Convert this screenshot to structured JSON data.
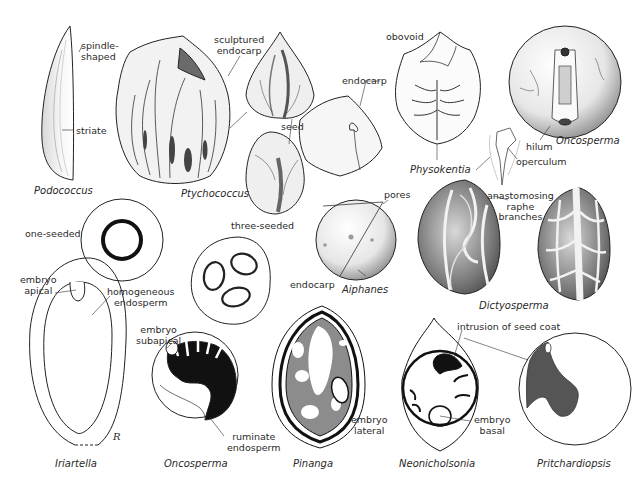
{
  "figure": {
    "colors": {
      "background": "#ffffff",
      "ink": "#1a1a1a",
      "shade_dark": "#555555",
      "shade_mid": "#8a8a8a",
      "shade_light": "#cfcfcf"
    }
  },
  "taxa": {
    "podococcus": "Podococcus",
    "ptychococcus": "Ptychococcus",
    "physokentia": "Physokentia",
    "oncosperma_top": "Oncosperma",
    "aiphanes": "Aiphanes",
    "dictyosperma": "Dictyosperma",
    "iriartella": "Iriartella",
    "oncosperma_bottom": "Oncosperma",
    "pinanga": "Pinanga",
    "neonicholsonia": "Neonicholsonia",
    "pritchardiopsis": "Pritchardiopsis"
  },
  "labels": {
    "spindle_shaped": "spindle-\nshaped",
    "striate": "striate",
    "sculptured_endocarp": "sculptured\nendocarp",
    "seed": "seed",
    "obovoid": "obovoid",
    "endocarp_top": "endocarp",
    "hilum": "hilum",
    "operculum": "operculum",
    "one_seeded": "one-seeded",
    "three_seeded": "three-seeded",
    "pores": "pores",
    "endocarp_aiphanes": "endocarp",
    "anastomosing_raphe": "anastomosing\nraphe\nbranches",
    "embryo_apical": "embryo\napical",
    "homogeneous_endosperm": "homogeneous\nendosperm",
    "embryo_subapical": "embryo\nsubapical",
    "ruminate_endosperm": "ruminate\nendosperm",
    "embryo_lateral": "embryo\nlateral",
    "intrusion_seed_coat": "intrusion of seed coat",
    "embryo_basal": "embryo\nbasal",
    "artist_mark": "R"
  }
}
